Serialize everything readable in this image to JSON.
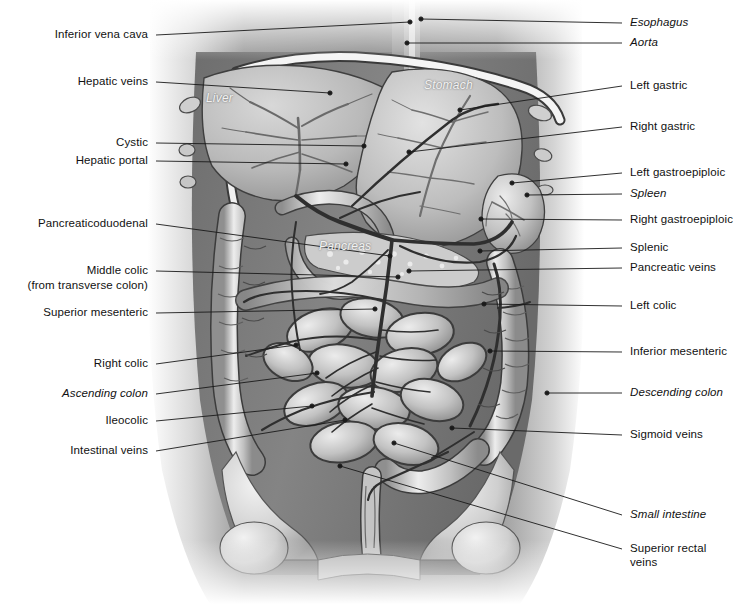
{
  "figure": {
    "kind": "anatomical-illustration",
    "style": "grayscale medical illustration, anterior view of abdominal cavity",
    "background_color": "#ffffff",
    "ink_color": "#111111"
  },
  "organ_labels": [
    {
      "text": "Liver",
      "x": 206,
      "y": 99,
      "tone": "light"
    },
    {
      "text": "Stomach",
      "x": 424,
      "y": 86,
      "tone": "light"
    },
    {
      "text": "Pancreas",
      "x": 319,
      "y": 247,
      "tone": "light"
    }
  ],
  "left_labels": [
    {
      "text": "Inferior vena cava",
      "x": 148,
      "y": 35,
      "italic": false,
      "line": [
        [
          156,
          35
        ],
        [
          410,
          22
        ]
      ]
    },
    {
      "text": "Hepatic veins",
      "x": 148,
      "y": 82,
      "italic": false,
      "line": [
        [
          156,
          82
        ],
        [
          330,
          93
        ]
      ]
    },
    {
      "text": "Cystic",
      "x": 148,
      "y": 143,
      "italic": false,
      "line": [
        [
          156,
          143
        ],
        [
          364,
          146
        ]
      ]
    },
    {
      "text": "Hepatic portal",
      "x": 148,
      "y": 161,
      "italic": false,
      "line": [
        [
          156,
          161
        ],
        [
          346,
          164
        ]
      ]
    },
    {
      "text": "Pancreaticoduodenal",
      "x": 148,
      "y": 224,
      "italic": false,
      "line": [
        [
          156,
          224
        ],
        [
          390,
          256
        ]
      ]
    },
    {
      "text": "Middle colic",
      "x": 148,
      "y": 271,
      "italic": false,
      "line": [
        [
          156,
          271
        ],
        [
          398,
          277
        ]
      ]
    },
    {
      "text": "(from transverse colon)",
      "x": 148,
      "y": 286,
      "italic": false,
      "line": null
    },
    {
      "text": "Superior mesenteric",
      "x": 148,
      "y": 313,
      "italic": false,
      "line": [
        [
          156,
          313
        ],
        [
          375,
          309
        ]
      ]
    },
    {
      "text": "Right colic",
      "x": 148,
      "y": 364,
      "italic": false,
      "line": [
        [
          156,
          364
        ],
        [
          296,
          345
        ]
      ]
    },
    {
      "text": "Ascending colon",
      "x": 148,
      "y": 394,
      "italic": true,
      "line": [
        [
          156,
          394
        ],
        [
          317,
          373
        ]
      ]
    },
    {
      "text": "Ileocolic",
      "x": 148,
      "y": 421,
      "italic": false,
      "line": [
        [
          156,
          421
        ],
        [
          312,
          406
        ]
      ]
    },
    {
      "text": "Intestinal veins",
      "x": 148,
      "y": 451,
      "italic": false,
      "line": [
        [
          156,
          451
        ],
        [
          345,
          420
        ]
      ]
    }
  ],
  "right_labels": [
    {
      "text": "Esophagus",
      "x": 630,
      "y": 23,
      "italic": true,
      "line": [
        [
          622,
          23
        ],
        [
          421,
          19
        ]
      ]
    },
    {
      "text": "Aorta",
      "x": 630,
      "y": 43,
      "italic": true,
      "line": [
        [
          622,
          43
        ],
        [
          407,
          43
        ]
      ]
    },
    {
      "text": "Left gastric",
      "x": 630,
      "y": 86,
      "italic": false,
      "line": [
        [
          622,
          86
        ],
        [
          460,
          110
        ]
      ]
    },
    {
      "text": "Right gastric",
      "x": 630,
      "y": 127,
      "italic": false,
      "line": [
        [
          622,
          127
        ],
        [
          409,
          152
        ]
      ]
    },
    {
      "text": "Left gastroepiploic",
      "x": 630,
      "y": 173,
      "italic": false,
      "line": [
        [
          622,
          173
        ],
        [
          512,
          183
        ]
      ]
    },
    {
      "text": "Spleen",
      "x": 630,
      "y": 194,
      "italic": true,
      "line": [
        [
          622,
          194
        ],
        [
          527,
          195
        ]
      ]
    },
    {
      "text": "Right gastroepiploic",
      "x": 630,
      "y": 220,
      "italic": false,
      "line": [
        [
          622,
          220
        ],
        [
          481,
          219
        ]
      ]
    },
    {
      "text": "Splenic",
      "x": 630,
      "y": 248,
      "italic": false,
      "line": [
        [
          622,
          248
        ],
        [
          480,
          251
        ]
      ]
    },
    {
      "text": "Pancreatic veins",
      "x": 630,
      "y": 268,
      "italic": false,
      "line": [
        [
          622,
          268
        ],
        [
          409,
          271
        ]
      ]
    },
    {
      "text": "Left colic",
      "x": 630,
      "y": 306,
      "italic": false,
      "line": [
        [
          622,
          306
        ],
        [
          484,
          304
        ]
      ]
    },
    {
      "text": "Inferior mesenteric",
      "x": 630,
      "y": 352,
      "italic": false,
      "line": [
        [
          622,
          352
        ],
        [
          490,
          351
        ]
      ]
    },
    {
      "text": "Descending colon",
      "x": 630,
      "y": 393,
      "italic": true,
      "line": [
        [
          622,
          393
        ],
        [
          547,
          393
        ]
      ]
    },
    {
      "text": "Sigmoid veins",
      "x": 630,
      "y": 435,
      "italic": false,
      "line": [
        [
          622,
          435
        ],
        [
          452,
          428
        ]
      ]
    },
    {
      "text": "Small intestine",
      "x": 630,
      "y": 515,
      "italic": true,
      "line": [
        [
          622,
          515
        ],
        [
          394,
          443
        ]
      ]
    },
    {
      "text": "Superior rectal",
      "x": 630,
      "y": 549,
      "italic": false,
      "line": [
        [
          622,
          549
        ],
        [
          340,
          466
        ]
      ]
    },
    {
      "text": "veins",
      "x": 630,
      "y": 563,
      "italic": false,
      "line": null
    }
  ]
}
